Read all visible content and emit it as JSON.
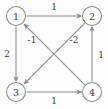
{
  "figure": {
    "kind": "directed-weighted-graph",
    "background_color": "#fdfdfd",
    "stroke_color": "#8c8c8c",
    "text_color": "#3a3a3a",
    "node_fill": "#ffffff"
  },
  "nodes": [
    {
      "id": "1",
      "label": "1",
      "cx": 16,
      "cy": 16,
      "r": 9.5
    },
    {
      "id": "2",
      "label": "2",
      "cx": 92,
      "cy": 16,
      "r": 9.5
    },
    {
      "id": "3",
      "label": "3",
      "cx": 16,
      "cy": 92,
      "r": 9.5
    },
    {
      "id": "4",
      "label": "4",
      "cx": 92,
      "cy": 92,
      "r": 9.5
    }
  ],
  "edges": [
    {
      "id": "e12",
      "from": "1",
      "to": "2",
      "weight": "1",
      "weight_x": 54,
      "weight_y": 7,
      "orientation": "top-horizontal"
    },
    {
      "id": "e13",
      "from": "1",
      "to": "3",
      "weight": "2",
      "weight_x": 7,
      "weight_y": 54,
      "orientation": "left-vertical"
    },
    {
      "id": "e34",
      "from": "3",
      "to": "4",
      "weight": "1",
      "weight_x": 54,
      "weight_y": 101,
      "orientation": "bottom-horizontal"
    },
    {
      "id": "e42",
      "from": "4",
      "to": "2",
      "weight": "1",
      "weight_x": 101,
      "weight_y": 55,
      "orientation": "right-vertical"
    },
    {
      "id": "e41",
      "from": "4",
      "to": "1",
      "weight": "-1",
      "weight_x": 32,
      "weight_y": 40,
      "orientation": "diagonal-up-left"
    },
    {
      "id": "e23",
      "from": "2",
      "to": "3",
      "weight": "-2",
      "weight_x": 74,
      "weight_y": 40,
      "orientation": "diagonal-down-left"
    }
  ]
}
